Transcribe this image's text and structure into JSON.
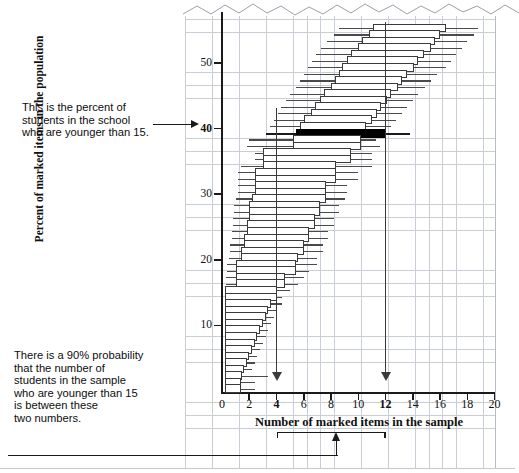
{
  "chart_data": {
    "type": "box",
    "title": "",
    "xlabel": "Number of marked items in the sample",
    "ylabel": "Percent of marked items in the population",
    "xlim": [
      0,
      20
    ],
    "ylim": [
      0,
      57
    ],
    "xticks": [
      0,
      2,
      4,
      6,
      8,
      10,
      12,
      14,
      16,
      18,
      20
    ],
    "xtick_labels": [
      "0",
      "2",
      "4",
      "6",
      "8",
      "10",
      "12",
      "14",
      "16",
      "18",
      "20"
    ],
    "xtick_bold": [
      4,
      12
    ],
    "yticks": [
      10,
      20,
      30,
      40,
      50
    ],
    "ytick_labels": [
      "10",
      "20",
      "30",
      "40",
      "50"
    ],
    "ytick_bold": [
      40
    ],
    "grid": true,
    "grid_color": "#c9cdd6",
    "highlight_row_y": 40,
    "highlight_color": "#000000",
    "reference_lines_x": [
      4,
      12
    ],
    "bracket_range": [
      4,
      12
    ],
    "series_name": "90% confidence interval per population percent",
    "rows": [
      {
        "y": 56,
        "lo": 8.6,
        "q1": 11.1,
        "q3": 16.4,
        "hi": 18.8
      },
      {
        "y": 55,
        "lo": 8.2,
        "q1": 10.8,
        "q3": 16.0,
        "hi": 18.5
      },
      {
        "y": 54,
        "lo": 7.7,
        "q1": 10.3,
        "q3": 15.6,
        "hi": 18.0
      },
      {
        "y": 53,
        "lo": 7.3,
        "q1": 10.0,
        "q3": 15.3,
        "hi": 17.6
      },
      {
        "y": 52,
        "lo": 6.9,
        "q1": 9.5,
        "q3": 14.8,
        "hi": 17.2
      },
      {
        "y": 51,
        "lo": 6.6,
        "q1": 9.2,
        "q3": 14.4,
        "hi": 16.8
      },
      {
        "y": 50,
        "lo": 6.3,
        "q1": 8.8,
        "q3": 14.1,
        "hi": 16.4
      },
      {
        "y": 49,
        "lo": 6.0,
        "q1": 8.6,
        "q3": 13.6,
        "hi": 15.8
      },
      {
        "y": 48,
        "lo": 5.7,
        "q1": 8.3,
        "q3": 13.2,
        "hi": 15.3
      },
      {
        "y": 47,
        "lo": 5.4,
        "q1": 8.0,
        "q3": 12.9,
        "hi": 14.9
      },
      {
        "y": 46,
        "lo": 5.0,
        "q1": 7.5,
        "q3": 12.4,
        "hi": 14.4
      },
      {
        "y": 45,
        "lo": 4.7,
        "q1": 7.2,
        "q3": 12.1,
        "hi": 14.0
      },
      {
        "y": 44,
        "lo": 4.3,
        "q1": 6.8,
        "q3": 11.7,
        "hi": 13.6
      },
      {
        "y": 43,
        "lo": 4.1,
        "q1": 6.5,
        "q3": 11.4,
        "hi": 13.2
      },
      {
        "y": 42,
        "lo": 3.8,
        "q1": 6.0,
        "q3": 11.0,
        "hi": 12.8
      },
      {
        "y": 41,
        "lo": 3.5,
        "q1": 5.7,
        "q3": 10.6,
        "hi": 12.4
      },
      {
        "y": 40,
        "lo": 3.2,
        "q1": 5.4,
        "q3": 12.0,
        "hi": 13.8,
        "highlight": true
      },
      {
        "y": 39,
        "lo": 2.0,
        "q1": 5.2,
        "q3": 10.2,
        "hi": 11.3
      },
      {
        "y": 38,
        "lo": 1.8,
        "q1": 5.2,
        "q3": 10.2,
        "hi": 11.6
      },
      {
        "y": 37,
        "lo": 2.4,
        "q1": 3.0,
        "q3": 9.5,
        "hi": 11.0
      },
      {
        "y": 36,
        "lo": 2.4,
        "q1": 3.0,
        "q3": 9.5,
        "hi": 11.0
      },
      {
        "y": 35,
        "lo": 1.4,
        "q1": 3.0,
        "q3": 8.4,
        "hi": 11.0
      },
      {
        "y": 34,
        "lo": 1.2,
        "q1": 2.4,
        "q3": 8.4,
        "hi": 10.0
      },
      {
        "y": 33,
        "lo": 1.2,
        "q1": 2.4,
        "q3": 8.4,
        "hi": 10.0
      },
      {
        "y": 32,
        "lo": 1.2,
        "q1": 2.4,
        "q3": 7.6,
        "hi": 9.2
      },
      {
        "y": 31,
        "lo": 1.2,
        "q1": 2.4,
        "q3": 7.6,
        "hi": 9.2
      },
      {
        "y": 30,
        "lo": 1.0,
        "q1": 2.2,
        "q3": 7.6,
        "hi": 9.0
      },
      {
        "y": 29,
        "lo": 0.9,
        "q1": 2.0,
        "q3": 7.2,
        "hi": 8.6
      },
      {
        "y": 28,
        "lo": 0.9,
        "q1": 2.0,
        "q3": 7.2,
        "hi": 8.6
      },
      {
        "y": 27,
        "lo": 0.8,
        "q1": 2.0,
        "q3": 6.8,
        "hi": 8.2
      },
      {
        "y": 26,
        "lo": 0.8,
        "q1": 1.8,
        "q3": 6.8,
        "hi": 8.2
      },
      {
        "y": 25,
        "lo": 0.7,
        "q1": 1.8,
        "q3": 6.4,
        "hi": 7.8
      },
      {
        "y": 24,
        "lo": 0.7,
        "q1": 1.6,
        "q3": 6.4,
        "hi": 7.8
      },
      {
        "y": 23,
        "lo": 0.6,
        "q1": 1.6,
        "q3": 6.0,
        "hi": 7.4
      },
      {
        "y": 22,
        "lo": 0.6,
        "q1": 1.4,
        "q3": 6.0,
        "hi": 7.4
      },
      {
        "y": 21,
        "lo": 0.5,
        "q1": 1.4,
        "q3": 5.6,
        "hi": 7.0
      },
      {
        "y": 20,
        "lo": 0.4,
        "q1": 1.0,
        "q3": 5.4,
        "hi": 7.0
      },
      {
        "y": 19,
        "lo": 0.4,
        "q1": 1.0,
        "q3": 5.4,
        "hi": 6.4
      },
      {
        "y": 18,
        "lo": 0.3,
        "q1": 1.0,
        "q3": 4.6,
        "hi": 6.0
      },
      {
        "y": 17,
        "lo": 0.3,
        "q1": 1.0,
        "q3": 4.6,
        "hi": 5.6
      },
      {
        "y": 16,
        "lo": 0.2,
        "q1": 0.2,
        "q3": 4.0,
        "hi": 5.0
      },
      {
        "y": 15,
        "lo": 0.2,
        "q1": 0.2,
        "q3": 4.0,
        "hi": 4.4
      },
      {
        "y": 14,
        "lo": 0.2,
        "q1": 0.2,
        "q3": 3.6,
        "hi": 4.4
      },
      {
        "y": 13,
        "lo": 0.2,
        "q1": 0.2,
        "q3": 3.4,
        "hi": 4.0
      },
      {
        "y": 12,
        "lo": 0.2,
        "q1": 0.2,
        "q3": 3.2,
        "hi": 3.8
      },
      {
        "y": 11,
        "lo": 0.2,
        "q1": 0.2,
        "q3": 3.0,
        "hi": 3.6
      },
      {
        "y": 10,
        "lo": 0.2,
        "q1": 0.2,
        "q3": 2.8,
        "hi": 3.4
      },
      {
        "y": 9,
        "lo": 0.2,
        "q1": 0.2,
        "q3": 2.6,
        "hi": 3.2
      },
      {
        "y": 8,
        "lo": 0.2,
        "q1": 0.2,
        "q3": 2.4,
        "hi": 3.0
      },
      {
        "y": 7,
        "lo": 0.2,
        "q1": 0.2,
        "q3": 2.2,
        "hi": 2.8
      },
      {
        "y": 6,
        "lo": 0.2,
        "q1": 0.2,
        "q3": 2.0,
        "hi": 2.6
      },
      {
        "y": 5,
        "lo": 0.2,
        "q1": 0.2,
        "q3": 1.8,
        "hi": 2.4
      },
      {
        "y": 4,
        "lo": 0.2,
        "q1": 0.2,
        "q3": 1.6,
        "hi": 2.2
      },
      {
        "y": 3,
        "lo": 0.2,
        "q1": 0.2,
        "q3": 1.5,
        "hi": 3.4
      },
      {
        "y": 2,
        "lo": 0.2,
        "q1": 0.2,
        "q3": 1.4,
        "hi": 2.4
      },
      {
        "y": 1,
        "lo": 0.2,
        "q1": 0.2,
        "q3": 1.4,
        "hi": 2.4
      }
    ]
  },
  "annotations": {
    "top_note": "This is the percent of\nstudents in the school\nwho are younger than 15.",
    "bottom_note": "There is a 90% probability\nthat the number of\nstudents in the sample\nwho are younger than 15\nis between these\ntwo numbers."
  }
}
